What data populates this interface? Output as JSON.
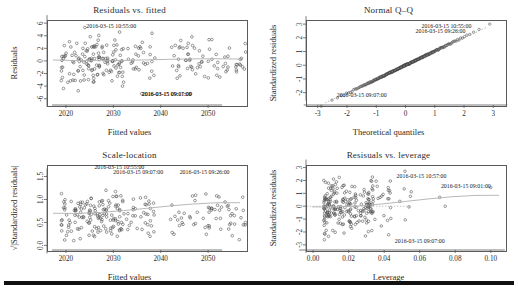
{
  "figure": {
    "panels": [
      "residuals-vs-fitted",
      "normal-qq",
      "scale-location",
      "residuals-vs-leverage"
    ],
    "axis_color": "#5a5a5a",
    "point_color": "#4a4a4a",
    "smoother_color": "#b0b0b0"
  },
  "chart_data": [
    {
      "type": "scatter",
      "name": "residuals-vs-fitted",
      "title": "Residuals vs. fitted",
      "xlabel": "Fitted values",
      "ylabel": "Residuals",
      "xlim": [
        2016,
        2058
      ],
      "ylim": [
        -7,
        6.5
      ],
      "xticks": [
        "2020",
        "2030",
        "2040",
        "2050"
      ],
      "xtick_values": [
        2020,
        2030,
        2040,
        2050
      ],
      "yticks": [
        "6",
        "4",
        "2",
        "0",
        "-2",
        "-4",
        "-6"
      ],
      "ytick_values": [
        6,
        4,
        2,
        0,
        -2,
        -4,
        -6
      ],
      "grid": false,
      "legend": "none",
      "smoother": {
        "type": "loess",
        "y_at_xmin": 0.15,
        "y_at_xmax": 0.3
      },
      "annotations": [
        {
          "label": "2016-03-15 10:55:00",
          "x": 2024.3,
          "y": 5.2
        },
        {
          "label": "2016-03-15 09:07:00",
          "x": 2036.0,
          "y": -5.6
        },
        {
          "label": "2016-03-15 09:11:00",
          "x": 2046.5,
          "y": -5.6
        }
      ],
      "x": [
        2019.2,
        2020.1,
        2021.4,
        2022.0,
        2022.6,
        2023.1,
        2023.4,
        2023.8,
        2024.2,
        2024.6,
        2025.0,
        2025.4,
        2025.9,
        2026.3,
        2026.8,
        2027.2,
        2027.6,
        2028.1,
        2028.6,
        2029.0,
        2029.5,
        2030.0,
        2030.4,
        2030.8,
        2031.2,
        2031.7,
        2032.1,
        2032.6,
        2033.0,
        2033.6,
        2034.1,
        2034.7,
        2035.2,
        2035.8,
        2036.4,
        2037.0,
        2038.1,
        2039.3,
        2040.4,
        2041.6,
        2042.7,
        2043.4,
        2044.0,
        2044.6,
        2045.2,
        2045.8,
        2046.4,
        2047.0,
        2047.6,
        2048.2,
        2048.8,
        2049.4,
        2050.0,
        2050.6,
        2051.2,
        2051.8,
        2052.4,
        2053.0,
        2053.6,
        2054.2,
        2054.8,
        2055.4,
        2056.0,
        2056.6,
        2057.2
      ],
      "y": [
        -0.2,
        -1.4,
        1.2,
        2.4,
        -2.1,
        0.9,
        3.2,
        -3.4,
        1.8,
        -0.6,
        2.6,
        -2.8,
        0.4,
        1.5,
        -1.1,
        2.0,
        -4.4,
        0.7,
        -0.9,
        1.9,
        2.8,
        -1.7,
        0.2,
        3.0,
        -2.3,
        1.1,
        -0.4,
        2.2,
        -3.1,
        0.6,
        1.4,
        -1.9,
        2.5,
        -0.8,
        1.0,
        -2.0,
        0.5,
        -1.3,
        -3.7,
        0.3,
        -0.5,
        0.1,
        0.0,
        -2.2,
        2.1,
        -3.6,
        1.6,
        3.4,
        -1.2,
        2.9,
        -0.7,
        1.3,
        -3.9,
        4.9,
        0.8,
        -2.6,
        3.8,
        -1.0,
        2.3,
        -4.1,
        0.2,
        3.6,
        -1.6,
        4.1,
        -2.4
      ]
    },
    {
      "type": "scatter",
      "name": "normal-qq",
      "title": "Normal Q–Q",
      "xlabel": "Theoretical quantiles",
      "ylabel": "Standardized residuals",
      "xlim": [
        -3.4,
        3.4
      ],
      "ylim": [
        -2.9,
        3.3
      ],
      "xticks": [
        "-3",
        "-2",
        "-1",
        "0",
        "1",
        "2",
        "3"
      ],
      "xtick_values": [
        -3,
        -2,
        -1,
        0,
        1,
        2,
        3
      ],
      "yticks": [
        "3",
        "2",
        "1",
        "0",
        "-1",
        "-2"
      ],
      "ytick_values": [
        3,
        2,
        1,
        0,
        -1,
        -2
      ],
      "grid": false,
      "legend": "none",
      "reference_line": {
        "slope": 1.0,
        "intercept": 0.0
      },
      "annotations": [
        {
          "label": "2016-03-15 10:55:00",
          "x": 2.25,
          "y": 2.75
        },
        {
          "label": "2016-03-15 09:26:00",
          "x": 2.05,
          "y": 2.35
        },
        {
          "label": "2016-03-15 09:07:00",
          "x": -2.35,
          "y": -2.35
        }
      ]
    },
    {
      "type": "scatter",
      "name": "scale-location",
      "title": "Scale-location",
      "xlabel": "Fitted values",
      "ylabel": "√|Standardized residuals|",
      "xlim": [
        2016,
        2058
      ],
      "ylim": [
        -0.1,
        1.75
      ],
      "xticks": [
        "2020",
        "2030",
        "2040",
        "2050"
      ],
      "xtick_values": [
        2020,
        2030,
        2040,
        2050
      ],
      "yticks": [
        "1.5",
        "1.0",
        "0.5",
        "0.0"
      ],
      "ytick_values": [
        1.5,
        1.0,
        0.5,
        0.0
      ],
      "grid": false,
      "legend": "none",
      "smoother": {
        "type": "loess",
        "y_at_xmin": 0.7,
        "y_at_xmax": 0.93
      },
      "annotations": [
        {
          "label": "2016-03-15 10:55:00",
          "x": 2026.0,
          "y": 1.66
        },
        {
          "label": "2016-03-15 09:07:00",
          "x": 2030.0,
          "y": 1.56
        },
        {
          "label": "2016-03-15 09:26:00",
          "x": 2044.0,
          "y": 1.56
        }
      ]
    },
    {
      "type": "scatter",
      "name": "residuals-vs-leverage",
      "title": "Resisuals vs. leverage",
      "xlabel": "Leverage",
      "ylabel": "Standardized residuals",
      "xlim": [
        -0.004,
        0.108
      ],
      "ylim": [
        -3.4,
        3.2
      ],
      "xticks": [
        "0.00",
        "0.02",
        "0.04",
        "0.06",
        "0.08",
        "0.10"
      ],
      "xtick_values": [
        0.0,
        0.02,
        0.04,
        0.06,
        0.08,
        0.1
      ],
      "yticks": [
        "3",
        "2",
        "1",
        "0",
        "-1",
        "-2",
        "-3"
      ],
      "ytick_values": [
        3,
        2,
        1,
        0,
        -1,
        -2,
        -3
      ],
      "grid": false,
      "legend": "none",
      "smoother": {
        "type": "loess",
        "y_at_xmin": -0.05,
        "y_at_xmax": 0.85
      },
      "annotations": [
        {
          "label": "2016-03-15 10:57:00",
          "x": 0.047,
          "y": 2.2
        },
        {
          "label": "2016-03-15 09:01:00",
          "x": 0.1,
          "y": 1.45
        },
        {
          "label": "2016-03-15 09:07:00",
          "x": 0.046,
          "y": -2.85
        }
      ]
    }
  ]
}
